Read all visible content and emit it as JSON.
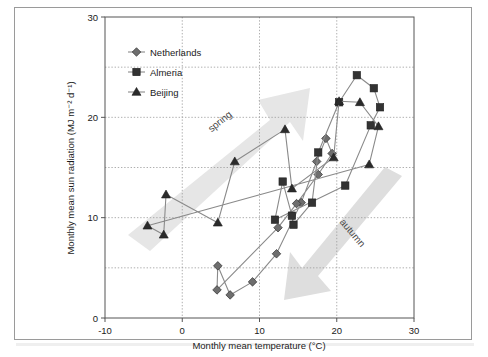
{
  "chart_data": {
    "type": "scatter",
    "title": "",
    "xlabel": "Monthly mean temperature (°C)",
    "ylabel": "Monthly mean sun radiation (MJ m⁻² d⁻¹)",
    "xlim": [
      -10,
      30
    ],
    "ylim": [
      0,
      30
    ],
    "xticks": [
      -10,
      0,
      10,
      20,
      30
    ],
    "xticklabels": [
      "-10",
      "0",
      "10",
      "20",
      "30"
    ],
    "yticks": [
      0,
      10,
      20,
      30
    ],
    "yticklabels": [
      "0",
      "10",
      "20",
      "30"
    ],
    "gridlines_x": [
      0,
      10,
      20
    ],
    "gridlines_y": [
      5,
      10,
      15,
      20,
      25
    ],
    "grid": "dotted",
    "legend_position": "top-left-inside",
    "series": [
      {
        "name": "Netherlands",
        "marker": "diamond",
        "color": "#6e6e6e",
        "line_color": "#8a8a8a",
        "closed_loop": true,
        "points": [
          [
            4.5,
            2.8
          ],
          [
            4.6,
            5.2
          ],
          [
            6.2,
            2.3
          ],
          [
            9.1,
            3.6
          ],
          [
            12.2,
            6.4
          ],
          [
            15.4,
            11.5
          ],
          [
            17.4,
            15.6
          ],
          [
            18.6,
            17.9
          ],
          [
            19.4,
            16.4
          ],
          [
            17.6,
            14.3
          ],
          [
            14.8,
            11.4
          ],
          [
            12.4,
            9.0
          ]
        ]
      },
      {
        "name": "Almeria",
        "marker": "square",
        "color": "#333333",
        "line_color": "#8a8a8a",
        "closed_loop": true,
        "points": [
          [
            12.0,
            9.8
          ],
          [
            13.0,
            13.6
          ],
          [
            14.2,
            10.2
          ],
          [
            14.4,
            9.3
          ],
          [
            16.8,
            11.5
          ],
          [
            17.6,
            16.5
          ],
          [
            20.3,
            21.5
          ],
          [
            22.6,
            24.2
          ],
          [
            24.8,
            22.9
          ],
          [
            25.6,
            21.0
          ],
          [
            24.4,
            19.2
          ],
          [
            21.1,
            13.2
          ]
        ]
      },
      {
        "name": "Beijing",
        "marker": "triangle",
        "color": "#2b2b2b",
        "line_color": "#8a8a8a",
        "closed_loop": true,
        "points": [
          [
            -4.5,
            9.2
          ],
          [
            -2.4,
            8.3
          ],
          [
            -2.1,
            12.3
          ],
          [
            4.6,
            9.5
          ],
          [
            6.8,
            15.6
          ],
          [
            13.3,
            18.8
          ],
          [
            14.2,
            12.9
          ],
          [
            19.6,
            16.0
          ],
          [
            20.3,
            21.6
          ],
          [
            23.0,
            21.5
          ],
          [
            25.4,
            19.1
          ],
          [
            24.2,
            15.3
          ]
        ]
      }
    ],
    "annotations": [
      {
        "name": "spring",
        "text": "spring",
        "direction": "up-right",
        "color": "#e2e2e2"
      },
      {
        "name": "autumn",
        "text": "autumn",
        "direction": "down-left",
        "color": "#dcdcdc"
      }
    ]
  },
  "legend": {
    "items": [
      {
        "label": "Netherlands",
        "marker": "diamond"
      },
      {
        "label": "Almeria",
        "marker": "square"
      },
      {
        "label": "Beijing",
        "marker": "triangle"
      }
    ]
  },
  "colors": {
    "frame": "#9a9a9a",
    "axis": "#555555",
    "grid": "#9a9a9a",
    "background": "#ffffff",
    "arrow": "#e0e0e0"
  }
}
